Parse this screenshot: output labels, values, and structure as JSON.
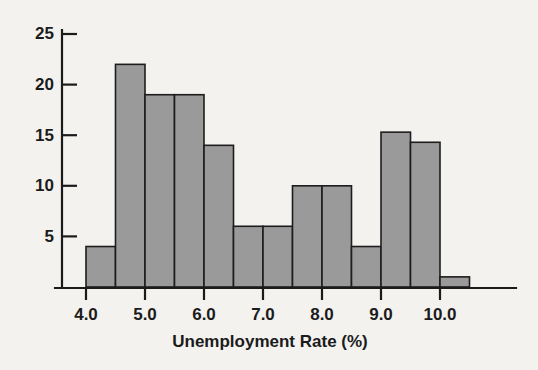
{
  "figure": {
    "background_color": "#f3f2ef",
    "axis_color": "#1b1b1b",
    "bar_fill_color": "#9a9a9a",
    "bar_edge_color": "#1d1d1d"
  },
  "axes": {
    "x_title": "Unemployment Rate (%)",
    "y_title": "",
    "x_tick_labels": [
      "4.0",
      "5.0",
      "6.0",
      "7.0",
      "8.0",
      "9.0",
      "10.0"
    ],
    "y_tick_labels": [
      "5",
      "10",
      "15",
      "20",
      "25"
    ]
  },
  "chart_data": {
    "type": "bar",
    "title": "",
    "subtitle": "",
    "xlabel": "Unemployment Rate (%)",
    "ylabel": "",
    "grid": false,
    "legend": null,
    "bin_width": 0.25,
    "bin_edges": [
      4.0,
      4.25,
      4.5,
      4.75,
      5.0,
      5.25,
      5.5,
      5.75,
      6.0,
      6.25,
      6.5,
      6.75,
      7.0,
      7.25,
      7.5,
      7.75,
      8.0,
      8.25,
      8.5,
      8.75,
      9.0,
      9.25,
      9.5,
      9.75,
      10.0,
      10.25,
      10.5
    ],
    "categories": [
      "4.00-4.25",
      "4.25-4.50",
      "4.50-4.75",
      "4.75-5.00",
      "5.00-5.25",
      "5.25-5.50",
      "5.50-5.75",
      "5.75-6.00",
      "6.00-6.25",
      "6.25-6.50",
      "6.50-6.75",
      "6.75-7.00",
      "7.00-7.25",
      "7.25-7.50",
      "7.50-7.75",
      "7.75-8.00",
      "8.00-8.25",
      "8.25-8.50",
      "8.50-8.75",
      "8.75-9.00",
      "9.00-9.25",
      "9.25-9.50",
      "9.50-9.75",
      "9.75-10.00",
      "10.00-10.25",
      "10.25-10.50"
    ],
    "values": [
      0,
      4,
      22,
      22,
      19,
      19,
      19,
      19,
      14,
      14,
      6,
      6,
      6,
      6,
      10,
      10,
      10,
      10,
      4,
      4,
      15.3,
      15.3,
      14.3,
      14.3,
      1,
      0
    ],
    "bars": [
      {
        "x_start": 4.0,
        "x_end": 4.5,
        "value": 4
      },
      {
        "x_start": 4.5,
        "x_end": 5.0,
        "value": 22
      },
      {
        "x_start": 5.0,
        "x_end": 5.5,
        "value": 19
      },
      {
        "x_start": 5.5,
        "x_end": 6.0,
        "value": 19
      },
      {
        "x_start": 6.0,
        "x_end": 6.5,
        "value": 14
      },
      {
        "x_start": 6.5,
        "x_end": 7.0,
        "value": 6
      },
      {
        "x_start": 7.0,
        "x_end": 7.5,
        "value": 6
      },
      {
        "x_start": 7.5,
        "x_end": 8.0,
        "value": 10
      },
      {
        "x_start": 8.0,
        "x_end": 8.5,
        "value": 10
      },
      {
        "x_start": 8.5,
        "x_end": 9.0,
        "value": 4
      },
      {
        "x_start": 9.0,
        "x_end": 9.5,
        "value": 15.3
      },
      {
        "x_start": 9.5,
        "x_end": 10.0,
        "value": 14.3
      },
      {
        "x_start": 10.0,
        "x_end": 10.5,
        "value": 1
      }
    ],
    "xlim": [
      3.75,
      11.0
    ],
    "ylim": [
      0,
      26.5
    ],
    "x_ticks": [
      4.0,
      5.0,
      6.0,
      7.0,
      8.0,
      9.0,
      10.0
    ],
    "y_ticks": [
      5,
      10,
      15,
      20,
      25
    ]
  }
}
